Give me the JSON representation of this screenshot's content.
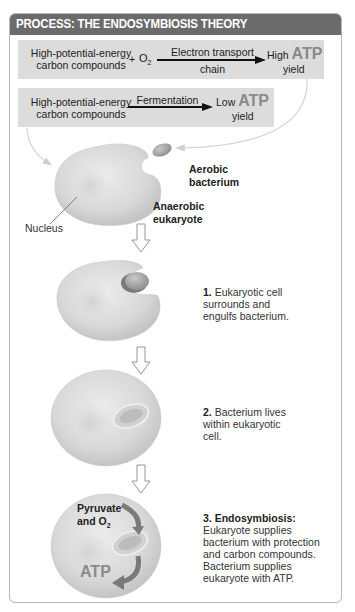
{
  "header": {
    "title": "PROCESS: THE ENDOSYMBIOSIS THEORY",
    "color": "#6b6b6b"
  },
  "equations": [
    {
      "reactant_line1": "High-potential-energy",
      "reactant_line2": "carbon compounds",
      "plus": "+",
      "oxygen": "O",
      "oxygen_sub": "2",
      "process_line1": "Electron transport",
      "process_line2": "chain",
      "yield_prefix": "High",
      "yield_atp": "ATP",
      "yield_suffix": "yield"
    },
    {
      "reactant_line1": "High-potential-energy",
      "reactant_line2": "carbon compounds",
      "process_line1": "Fermentation",
      "yield_prefix": "Low",
      "yield_atp": "ATP",
      "yield_suffix": "yield"
    }
  ],
  "labels": {
    "aerobic_bacterium_line1": "Aerobic",
    "aerobic_bacterium_line2": "bacterium",
    "anaerobic_eukaryote_line1": "Anaerobic",
    "anaerobic_eukaryote_line2": "eukaryote",
    "nucleus": "Nucleus",
    "pyruvate_line1": "Pyruvate",
    "pyruvate_line2": "and O",
    "pyruvate_sub": "2",
    "atp": "ATP"
  },
  "steps": [
    {
      "number": "1.",
      "lines": [
        "Eukaryotic cell",
        "surrounds and",
        "engulfs bacterium."
      ]
    },
    {
      "number": "2.",
      "lines": [
        "Bacterium lives",
        "within eukaryotic",
        "cell."
      ]
    },
    {
      "number": "3.",
      "title": "Endosymbiosis:",
      "lines": [
        "Eukaryote supplies",
        "bacterium with protection",
        "and carbon compounds.",
        "Bacterium supplies",
        "eukaryote with ATP."
      ]
    }
  ],
  "colors": {
    "atp_text": "#8a8a8a",
    "equation_box": "#dcdcdc",
    "cell": "#d6d6d6",
    "flow_arrow": "#7a7a7a"
  }
}
